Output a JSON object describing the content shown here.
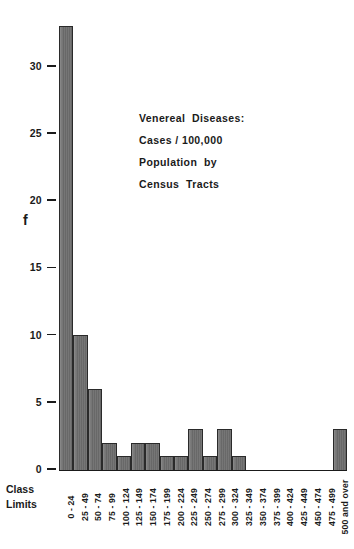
{
  "chart_data": {
    "type": "bar",
    "title": "",
    "xlabel": "Class Limits",
    "ylabel": "f",
    "ylim": [
      0,
      34
    ],
    "grid": false,
    "legend": null,
    "categories": [
      "0 - 24",
      "25 - 49",
      "50 - 74",
      "75 - 99",
      "100 - 124",
      "125 - 149",
      "150 - 174",
      "175 - 199",
      "200 - 224",
      "225 - 249",
      "250 - 274",
      "275 - 299",
      "300 - 324",
      "325 - 349",
      "350 - 374",
      "375 - 399",
      "400 - 424",
      "425 - 449",
      "450 - 474",
      "475 - 499",
      "500 and over"
    ],
    "values": [
      33,
      10,
      6,
      2,
      1,
      2,
      2,
      1,
      1,
      3,
      1,
      3,
      1,
      0,
      0,
      0,
      0,
      0,
      0,
      0,
      3
    ],
    "y_ticks": [
      0,
      5,
      10,
      15,
      20,
      25,
      30
    ],
    "annotation": [
      "Venereal  Diseases:",
      "Cases / 100,000",
      "Population  by",
      "Census  Tracts"
    ]
  },
  "axis": {
    "y_title": "f",
    "x_title_line1": "Class",
    "x_title_line2": "Limits"
  },
  "colors": {
    "bar_fill": "#6e6e6e",
    "bar_stroke": "#2a2a2a",
    "text": "#1a1a1a",
    "background": "#ffffff"
  }
}
